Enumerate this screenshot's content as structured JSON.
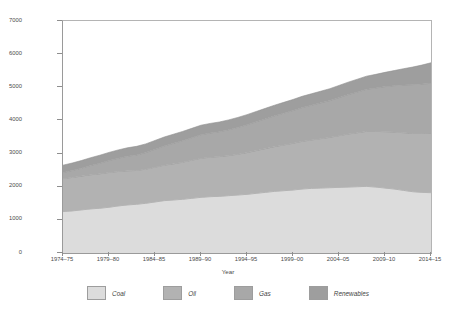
{
  "axes": {
    "y_title": "Australian primary energy consumption (PJ)",
    "x_title": "Year",
    "y_ticks": [
      "7000",
      "6000",
      "5000",
      "4000",
      "3000",
      "2000",
      "1000",
      "0"
    ],
    "x_ticks": [
      "1974–75",
      "1979–80",
      "1984–85",
      "1989–90",
      "1994–95",
      "1999–00",
      "2004–05",
      "2009–10",
      "2014–15"
    ]
  },
  "legend": {
    "items": [
      {
        "label": "Coal",
        "color": "#dcdcdc"
      },
      {
        "label": "Oil",
        "color": "#b2b2b2"
      },
      {
        "label": "Gas",
        "color": "#a8a8a8"
      },
      {
        "label": "Renewables",
        "color": "#9e9e9e"
      }
    ]
  },
  "caption": {
    "text": ""
  },
  "chart_data": {
    "type": "area",
    "stacked": true,
    "title": "",
    "xlabel": "Year",
    "ylabel": "Australian primary energy consumption (PJ)",
    "ylim": [
      0,
      7000
    ],
    "ytick_step": 1000,
    "grid": false,
    "legend_position": "bottom",
    "x": [
      "1974–75",
      "1975–76",
      "1976–77",
      "1977–78",
      "1978–79",
      "1979–80",
      "1980–81",
      "1981–82",
      "1982–83",
      "1983–84",
      "1984–85",
      "1985–86",
      "1986–87",
      "1987–88",
      "1988–89",
      "1989–90",
      "1990–91",
      "1991–92",
      "1992–93",
      "1993–94",
      "1994–95",
      "1995–96",
      "1996–97",
      "1997–98",
      "1998–99",
      "1999–00",
      "2000–01",
      "2001–02",
      "2002–03",
      "2003–04",
      "2004–05",
      "2005–06",
      "2006–07",
      "2007–08",
      "2008–09",
      "2009–10",
      "2010–11",
      "2011–12",
      "2012–13",
      "2013–14",
      "2014–15"
    ],
    "x_major_ticks": [
      "1974–75",
      "1979–80",
      "1984–85",
      "1989–90",
      "1994–95",
      "1999–00",
      "2004–05",
      "2009–10",
      "2014–15"
    ],
    "series": [
      {
        "name": "Coal",
        "color": "#dcdcdc",
        "values": [
          1250,
          1270,
          1300,
          1330,
          1350,
          1380,
          1420,
          1450,
          1470,
          1500,
          1540,
          1580,
          1600,
          1620,
          1650,
          1680,
          1700,
          1710,
          1730,
          1750,
          1770,
          1800,
          1830,
          1860,
          1880,
          1900,
          1930,
          1950,
          1960,
          1970,
          1980,
          1990,
          2000,
          2010,
          1990,
          1960,
          1930,
          1890,
          1850,
          1830,
          1820
        ]
      },
      {
        "name": "Oil",
        "color": "#b2b2b2",
        "values": [
          1000,
          1010,
          1020,
          1030,
          1040,
          1050,
          1040,
          1030,
          1020,
          1030,
          1050,
          1070,
          1090,
          1120,
          1150,
          1180,
          1190,
          1200,
          1210,
          1230,
          1260,
          1290,
          1320,
          1350,
          1380,
          1410,
          1440,
          1460,
          1490,
          1520,
          1560,
          1600,
          1630,
          1660,
          1680,
          1700,
          1720,
          1740,
          1760,
          1780,
          1800
        ]
      },
      {
        "name": "Gas",
        "color": "#a8a8a8",
        "values": [
          180,
          210,
          240,
          280,
          320,
          360,
          400,
          440,
          470,
          500,
          540,
          580,
          620,
          650,
          680,
          710,
          730,
          750,
          780,
          810,
          840,
          870,
          900,
          930,
          960,
          990,
          1020,
          1050,
          1080,
          1110,
          1150,
          1190,
          1230,
          1270,
          1310,
          1360,
          1400,
          1440,
          1470,
          1490,
          1500
        ]
      },
      {
        "name": "Renewables",
        "color": "#9e9e9e",
        "values": [
          220,
          225,
          230,
          235,
          240,
          245,
          250,
          255,
          258,
          262,
          266,
          270,
          274,
          278,
          282,
          286,
          290,
          293,
          296,
          300,
          305,
          310,
          315,
          320,
          326,
          332,
          338,
          344,
          350,
          358,
          366,
          375,
          385,
          396,
          410,
          430,
          455,
          490,
          530,
          570,
          620
        ]
      }
    ],
    "totals_note": "Total rises from approximately 2650 PJ in 1974–75 to approximately 5740 PJ in 2014–15"
  }
}
